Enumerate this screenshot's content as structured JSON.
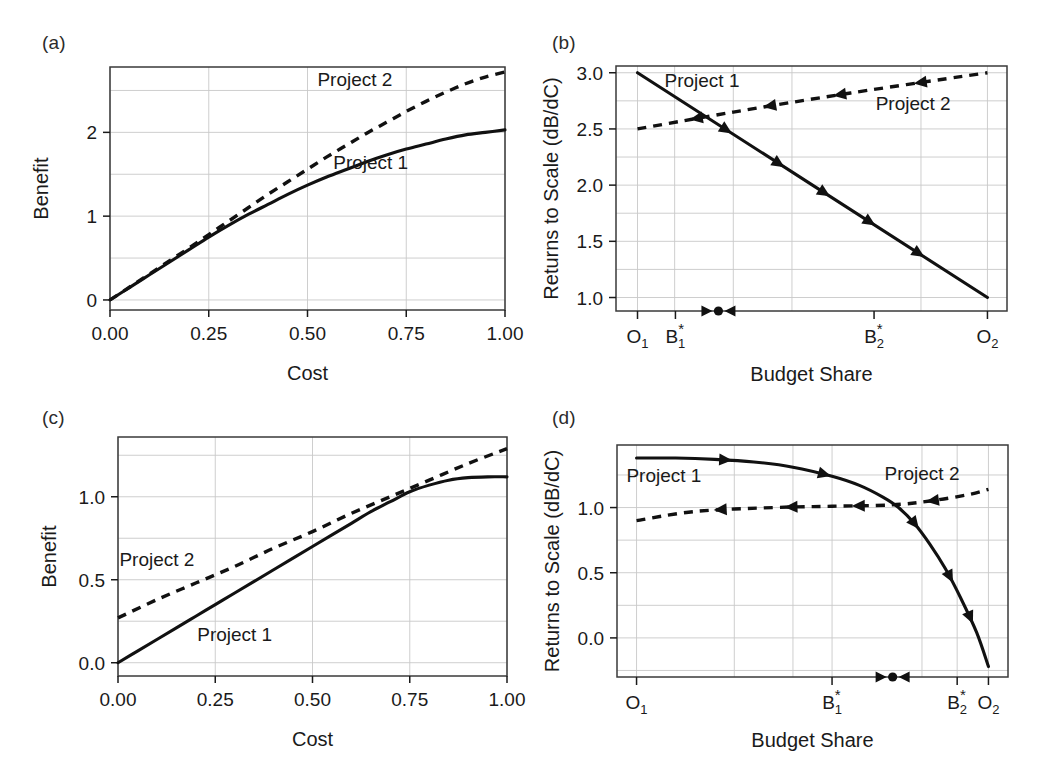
{
  "figure": {
    "width": 1048,
    "height": 783,
    "background": "#ffffff",
    "ink_color": "#111111",
    "grid_color": "#c8c8c8"
  },
  "panels": [
    {
      "id": "a",
      "label": "(a)",
      "chart_data": {
        "type": "line",
        "title": "",
        "xlabel": "Cost",
        "ylabel": "Benefit",
        "xlim": [
          0.0,
          1.0
        ],
        "ylim": [
          -0.12,
          2.78
        ],
        "xticks": [
          0.0,
          0.25,
          0.5,
          0.75,
          1.0
        ],
        "xticklabels": [
          "0.00",
          "0.25",
          "0.50",
          "0.75",
          "1.00"
        ],
        "yticks": [
          0,
          1,
          2
        ],
        "yticklabels": [
          "0",
          "1",
          "2"
        ],
        "grid": true,
        "legend": "inline-annotations",
        "series": [
          {
            "name": "Project 1",
            "style": "solid",
            "label_x": 0.66,
            "label_y": 1.63,
            "x": [
              0.0,
              0.05,
              0.1,
              0.15,
              0.2,
              0.25,
              0.3,
              0.35,
              0.4,
              0.45,
              0.5,
              0.55,
              0.6,
              0.65,
              0.7,
              0.75,
              0.8,
              0.85,
              0.9,
              0.95,
              1.0
            ],
            "y": [
              0.0,
              0.15,
              0.3,
              0.45,
              0.6,
              0.75,
              0.89,
              1.02,
              1.14,
              1.26,
              1.37,
              1.47,
              1.56,
              1.65,
              1.73,
              1.8,
              1.86,
              1.92,
              1.97,
              2.0,
              2.03
            ]
          },
          {
            "name": "Project 2",
            "style": "dashed",
            "label_x": 0.62,
            "label_y": 2.62,
            "x": [
              0.0,
              0.05,
              0.1,
              0.15,
              0.2,
              0.25,
              0.3,
              0.35,
              0.4,
              0.45,
              0.5,
              0.55,
              0.6,
              0.65,
              0.7,
              0.75,
              0.8,
              0.85,
              0.9,
              0.95,
              1.0
            ],
            "y": [
              0.0,
              0.155,
              0.31,
              0.465,
              0.62,
              0.78,
              0.94,
              1.1,
              1.26,
              1.41,
              1.56,
              1.71,
              1.85,
              1.99,
              2.12,
              2.25,
              2.37,
              2.48,
              2.58,
              2.66,
              2.72
            ]
          }
        ]
      }
    },
    {
      "id": "b",
      "label": "(b)",
      "chart_data": {
        "type": "line",
        "title": "",
        "xlabel": "Budget Share",
        "ylabel": "Returns to Scale (dB/dC)",
        "xlim": [
          0.0,
          1.0
        ],
        "ylim": [
          0.88,
          3.06
        ],
        "yticks": [
          1.0,
          1.5,
          2.0,
          2.5,
          3.0
        ],
        "yticklabels": [
          "1.0",
          "1.5",
          "2.0",
          "2.5",
          "3.0"
        ],
        "xticks": [
          0.055,
          0.15,
          0.95
        ],
        "xticklabels": [
          "O1",
          "B1*",
          "O2"
        ],
        "category_ticks": [
          {
            "label": "O",
            "sub": "1",
            "sup": "",
            "pos": 0.055
          },
          {
            "label": "B",
            "sub": "1",
            "sup": "*",
            "pos": 0.152
          },
          {
            "label": "B",
            "sub": "2",
            "sup": "*",
            "pos": 0.66
          },
          {
            "label": "O",
            "sub": "2",
            "sup": "",
            "pos": 0.95
          }
        ],
        "grid": true,
        "equilibrium": {
          "pos": 0.262,
          "marker": "dot-with-converging-arrows"
        },
        "series": [
          {
            "name": "Project 1",
            "style": "solid",
            "direction": "right",
            "label_x": 0.22,
            "label_y": 2.93,
            "arrow_positions": [
              0.27,
              0.42,
              0.55,
              0.68,
              0.82
            ],
            "x": [
              0.055,
              0.95
            ],
            "y": [
              3.0,
              1.0
            ]
          },
          {
            "name": "Project 2",
            "style": "dashed",
            "direction": "left",
            "label_x": 0.76,
            "label_y": 2.72,
            "arrow_positions": [
              0.15,
              0.36,
              0.56,
              0.79
            ],
            "x": [
              0.055,
              0.3,
              0.6,
              0.95
            ],
            "y": [
              2.5,
              2.65,
              2.82,
              3.0
            ]
          }
        ]
      }
    },
    {
      "id": "c",
      "label": "(c)",
      "chart_data": {
        "type": "line",
        "title": "",
        "xlabel": "Cost",
        "ylabel": "Benefit",
        "xlim": [
          0.0,
          1.0
        ],
        "ylim": [
          -0.08,
          1.36
        ],
        "xticks": [
          0.0,
          0.25,
          0.5,
          0.75,
          1.0
        ],
        "xticklabels": [
          "0.00",
          "0.25",
          "0.50",
          "0.75",
          "1.00"
        ],
        "yticks": [
          0.0,
          0.5,
          1.0
        ],
        "yticklabels": [
          "0.0",
          "0.5",
          "1.0"
        ],
        "grid": true,
        "series": [
          {
            "name": "Project 1",
            "style": "solid",
            "label_x": 0.3,
            "label_y": 0.17,
            "x": [
              0.0,
              0.05,
              0.1,
              0.15,
              0.2,
              0.25,
              0.3,
              0.35,
              0.4,
              0.45,
              0.5,
              0.55,
              0.6,
              0.65,
              0.7,
              0.75,
              0.8,
              0.85,
              0.9,
              0.95,
              1.0
            ],
            "y": [
              0.0,
              0.07,
              0.14,
              0.21,
              0.28,
              0.35,
              0.42,
              0.49,
              0.56,
              0.63,
              0.7,
              0.77,
              0.84,
              0.91,
              0.97,
              1.03,
              1.07,
              1.1,
              1.115,
              1.12,
              1.12
            ]
          },
          {
            "name": "Project 2",
            "style": "dashed",
            "label_x": 0.1,
            "label_y": 0.62,
            "x": [
              0.0,
              0.1,
              0.2,
              0.3,
              0.4,
              0.5,
              0.6,
              0.7,
              0.8,
              0.9,
              1.0
            ],
            "y": [
              0.27,
              0.38,
              0.48,
              0.58,
              0.69,
              0.79,
              0.9,
              1.0,
              1.1,
              1.2,
              1.29
            ]
          }
        ]
      }
    },
    {
      "id": "d",
      "label": "(d)",
      "chart_data": {
        "type": "line",
        "title": "",
        "xlabel": "Budget Share",
        "ylabel": "Returns to Scale (dB/dC)",
        "xlim": [
          0.0,
          1.0
        ],
        "ylim": [
          -0.3,
          1.48
        ],
        "yticks": [
          0.0,
          0.5,
          1.0
        ],
        "yticklabels": [
          "0.0",
          "0.5",
          "1.0"
        ],
        "category_ticks": [
          {
            "label": "O",
            "sub": "1",
            "sup": "",
            "pos": 0.05
          },
          {
            "label": "B",
            "sub": "1",
            "sup": "*",
            "pos": 0.55
          },
          {
            "label": "B",
            "sub": "2",
            "sup": "*",
            "pos": 0.87
          },
          {
            "label": "O",
            "sub": "2",
            "sup": "",
            "pos": 0.95
          }
        ],
        "grid": true,
        "equilibrium": {
          "pos": 0.705,
          "marker": "dot-with-converging-arrows"
        },
        "series": [
          {
            "name": "Project 1",
            "style": "solid",
            "direction": "right",
            "label_x": 0.12,
            "label_y": 1.24,
            "arrow_positions": [
              0.21,
              0.43,
              0.66,
              0.8,
              0.9
            ],
            "x": [
              0.05,
              0.15,
              0.25,
              0.35,
              0.45,
              0.55,
              0.62,
              0.68,
              0.72,
              0.76,
              0.8,
              0.84,
              0.88,
              0.92,
              0.95
            ],
            "y": [
              1.38,
              1.38,
              1.37,
              1.35,
              1.31,
              1.24,
              1.17,
              1.08,
              1.0,
              0.88,
              0.72,
              0.53,
              0.3,
              0.04,
              -0.22
            ]
          },
          {
            "name": "Project 2",
            "style": "dashed",
            "direction": "left",
            "label_x": 0.78,
            "label_y": 1.26,
            "arrow_positions": [
              0.22,
              0.42,
              0.61,
              0.82
            ],
            "x": [
              0.05,
              0.2,
              0.4,
              0.55,
              0.7,
              0.8,
              0.9,
              0.95
            ],
            "y": [
              0.9,
              0.97,
              1.0,
              1.01,
              1.02,
              1.05,
              1.1,
              1.14
            ]
          }
        ]
      }
    }
  ]
}
